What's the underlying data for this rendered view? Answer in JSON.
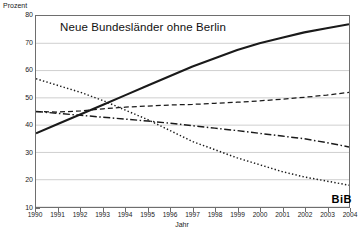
{
  "chart_data": {
    "type": "line",
    "title": "Neue Bundesländer ohne Berlin",
    "xlabel": "Jahr",
    "ylabel": "Prozent",
    "ylim": [
      10,
      80
    ],
    "xlim": [
      1990,
      2004
    ],
    "yticks": [
      80,
      70,
      60,
      50,
      40,
      30,
      20,
      10
    ],
    "grid": true,
    "legend_position": "none",
    "annotation": "BiB",
    "x": [
      1990,
      1991,
      1992,
      1993,
      1994,
      1995,
      1996,
      1997,
      1998,
      1999,
      2000,
      2001,
      2002,
      2003,
      2004
    ],
    "series": [
      {
        "name": "solid-rising",
        "style": "solid",
        "values": [
          37.0,
          40.5,
          44.0,
          47.5,
          51.0,
          54.5,
          58.0,
          61.5,
          64.5,
          67.5,
          70.0,
          72.0,
          74.0,
          75.5,
          77.0
        ]
      },
      {
        "name": "dashed",
        "style": "dashed",
        "values": [
          45.0,
          44.8,
          45.2,
          46.0,
          46.6,
          47.0,
          47.4,
          47.6,
          48.0,
          48.4,
          48.9,
          49.5,
          50.2,
          51.0,
          52.0
        ]
      },
      {
        "name": "dash-dot",
        "style": "dash-dot",
        "values": [
          45.0,
          44.3,
          43.6,
          42.9,
          42.2,
          41.5,
          40.7,
          39.8,
          38.9,
          38.0,
          37.0,
          36.0,
          35.0,
          33.6,
          32.0
        ]
      },
      {
        "name": "dotted-falling",
        "style": "dotted",
        "values": [
          57.0,
          54.5,
          52.0,
          49.0,
          45.5,
          42.0,
          38.0,
          34.0,
          31.0,
          28.0,
          25.5,
          23.0,
          21.0,
          19.5,
          18.0
        ]
      }
    ]
  },
  "axis": {
    "ylabel": "Prozent",
    "xlabel": "Jahr",
    "yticks": [
      "80",
      "70",
      "60",
      "50",
      "40",
      "30",
      "20",
      "10"
    ],
    "xticks": [
      "1990",
      "1991",
      "1992",
      "1993",
      "1994",
      "1995",
      "1996",
      "1997",
      "1998",
      "1999",
      "2000",
      "2001",
      "2002",
      "2003",
      "2004"
    ]
  },
  "title": "Neue Bundesländer ohne Berlin",
  "logo": "BiB",
  "colors": {
    "line": "#1a1a1a",
    "grid": "#cfcfcf",
    "frame": "#6e6e6e",
    "text": "#111111",
    "background": "#ffffff"
  }
}
